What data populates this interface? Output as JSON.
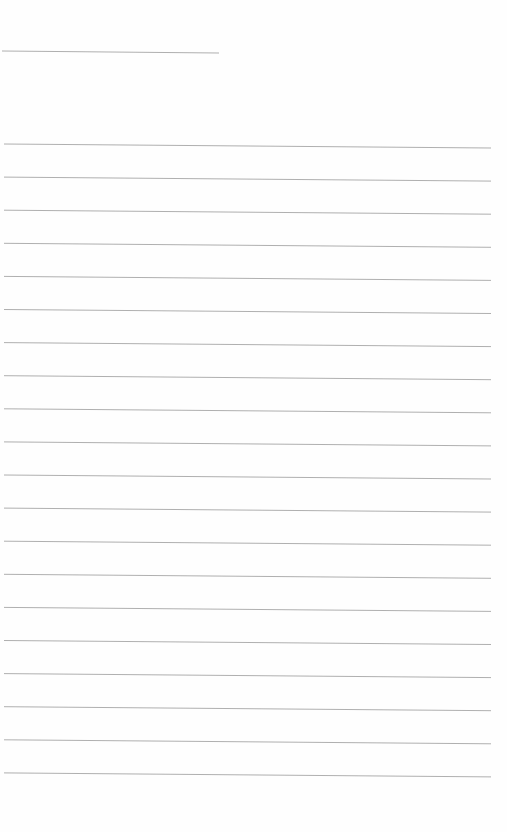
{
  "page": {
    "background": "#fefefe",
    "line_color": "#9a9a9a",
    "header_line": {
      "x1": 2,
      "y1": 51,
      "x2": 219,
      "y2": 53
    },
    "ruled_lines": {
      "count": 20,
      "start_y": 144,
      "spacing": 33.1,
      "x1": 4,
      "x2": 491,
      "tilt": 4
    },
    "text": []
  }
}
